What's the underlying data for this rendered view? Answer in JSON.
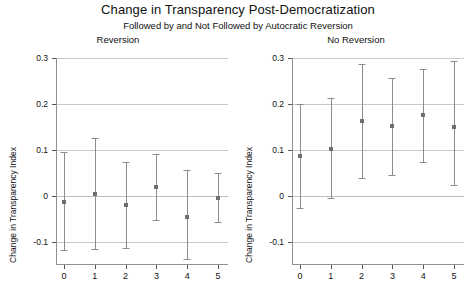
{
  "chart_data": {
    "type": "scatter",
    "title": "Change in Transparency Post-Democratization",
    "subtitle": "Followed by and Not Followed by Autocratic Reversion",
    "xlabel": "",
    "ylabel": "Change in Transparency Index",
    "x": [
      0,
      1,
      2,
      3,
      4,
      5
    ],
    "xtick_labels": [
      "0",
      "1",
      "2",
      "3",
      "4",
      "5"
    ],
    "ytick_labels": [
      "0.3",
      "0.2",
      "0.1",
      "0",
      "-0.1"
    ],
    "ytick_values": [
      0.3,
      0.2,
      0.1,
      0,
      -0.1
    ],
    "ylim": [
      -0.145,
      0.3
    ],
    "xlim": [
      -0.45,
      5.45
    ],
    "grid": true,
    "legend": "none",
    "panels": [
      {
        "name": "Reversion",
        "title": "Reversion",
        "series": [
          {
            "name": "Change in Transparency Index",
            "values": [
              -0.013,
              0.004,
              -0.02,
              0.019,
              -0.045,
              -0.004
            ],
            "ci_lower": [
              -0.118,
              -0.116,
              -0.113,
              -0.052,
              -0.136,
              -0.057
            ],
            "ci_upper": [
              0.096,
              0.127,
              0.074,
              0.092,
              0.057,
              0.05
            ]
          }
        ]
      },
      {
        "name": "No Reversion",
        "title": "No Reversion",
        "series": [
          {
            "name": "Change in Transparency Index",
            "values": [
              0.087,
              0.103,
              0.162,
              0.152,
              0.176,
              0.151
            ],
            "ci_lower": [
              -0.026,
              -0.004,
              0.039,
              0.046,
              0.073,
              0.024
            ],
            "ci_upper": [
              0.2,
              0.212,
              0.287,
              0.257,
              0.277,
              0.294
            ]
          }
        ]
      }
    ]
  },
  "colors": {
    "background": "#ffffff",
    "grid": "#c9c9c9",
    "axis": "#8f8f8f",
    "marker": "#6e6e6e",
    "errorbar": "#8c8c8c",
    "text": "#111111"
  }
}
